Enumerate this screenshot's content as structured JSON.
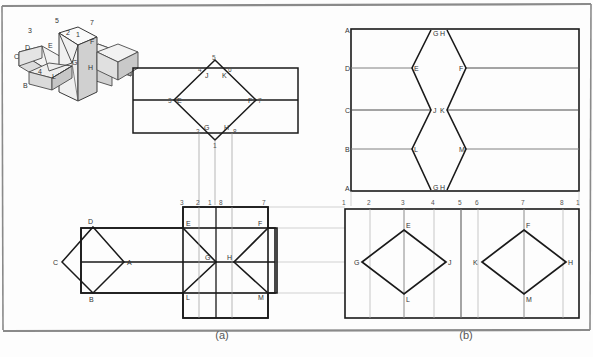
{
  "figure": {
    "captions": [
      {
        "key": "a",
        "text": "(a)"
      },
      {
        "key": "b",
        "text": "(b)"
      }
    ],
    "colors": {
      "outline": "#1a1a1a",
      "projector": "#9a9a9a",
      "frame": "#7d7d7d",
      "label": "#333333",
      "number": "#555555",
      "shade_light": "#efefef",
      "shade_mid": "#d8d8d8",
      "shade_dark": "#bdbdbd",
      "background": "#fdfdfd"
    }
  },
  "pictorial": {
    "name": "isometric-cross-solid",
    "vertex_labels": [
      "3",
      "5",
      "7",
      "2",
      "1",
      "D",
      "E",
      "C",
      "G",
      "F",
      "B",
      "4",
      "L",
      "H"
    ],
    "labels": [
      {
        "text": "3",
        "x": 28,
        "y": 33
      },
      {
        "text": "5",
        "x": 55,
        "y": 23
      },
      {
        "text": "7",
        "x": 90,
        "y": 25
      },
      {
        "text": "2",
        "x": 66,
        "y": 35
      },
      {
        "text": "1",
        "x": 76,
        "y": 37
      },
      {
        "text": "D",
        "x": 25,
        "y": 50
      },
      {
        "text": "E",
        "x": 48,
        "y": 48
      },
      {
        "text": "C",
        "x": 14,
        "y": 59
      },
      {
        "text": "G",
        "x": 72,
        "y": 65
      },
      {
        "text": "F",
        "x": 90,
        "y": 44
      },
      {
        "text": "B",
        "x": 23,
        "y": 88
      },
      {
        "text": "4",
        "x": 38,
        "y": 74
      },
      {
        "text": "L",
        "x": 52,
        "y": 79
      },
      {
        "text": "H",
        "x": 88,
        "y": 70
      }
    ]
  },
  "top_a": {
    "name": "top-view-a",
    "numbers": [
      {
        "text": "5",
        "x": 215,
        "y": 61
      },
      {
        "text": "4",
        "x": 200,
        "y": 71
      },
      {
        "text": "6",
        "x": 228,
        "y": 71
      },
      {
        "text": "3",
        "x": 174,
        "y": 100
      },
      {
        "text": "7",
        "x": 256,
        "y": 101
      },
      {
        "text": "2",
        "x": 198,
        "y": 132
      },
      {
        "text": "8",
        "x": 232,
        "y": 132
      },
      {
        "text": "1",
        "x": 216,
        "y": 143
      }
    ],
    "letters": [
      {
        "text": "J",
        "x": 207,
        "y": 74
      },
      {
        "text": "K",
        "x": 222,
        "y": 74
      },
      {
        "text": "E",
        "x": 183,
        "y": 100
      },
      {
        "text": "F",
        "x": 248,
        "y": 100
      },
      {
        "text": "G",
        "x": 206,
        "y": 130
      },
      {
        "text": "H",
        "x": 224,
        "y": 128
      }
    ]
  },
  "top_b": {
    "name": "development-view-b-upper",
    "left_edge_labels": [
      {
        "text": "A",
        "y": 32
      },
      {
        "text": "D",
        "y": 70
      },
      {
        "text": "C",
        "y": 110
      },
      {
        "text": "B",
        "y": 149
      },
      {
        "text": "A",
        "y": 188
      }
    ],
    "zigzag_left_labels": [
      {
        "text": "G",
        "x": 428,
        "y": 33
      },
      {
        "text": "E",
        "x": 408,
        "y": 71
      },
      {
        "text": "J",
        "x": 428,
        "y": 110
      },
      {
        "text": "L",
        "x": 408,
        "y": 149
      },
      {
        "text": "G",
        "x": 428,
        "y": 188
      }
    ],
    "zigzag_right_labels": [
      {
        "text": "H",
        "x": 447,
        "y": 33
      },
      {
        "text": "F",
        "x": 468,
        "y": 71
      },
      {
        "text": "K",
        "x": 447,
        "y": 110
      },
      {
        "text": "M",
        "x": 468,
        "y": 149
      },
      {
        "text": "H",
        "x": 447,
        "y": 188
      }
    ]
  },
  "bottom_a": {
    "name": "front-view-a",
    "top_numbers": [
      {
        "text": "3",
        "x": 178,
        "y": 203
      },
      {
        "text": "2",
        "x": 209,
        "y": 203
      },
      {
        "text": "1",
        "x": 221,
        "y": 203
      },
      {
        "text": "8",
        "x": 233,
        "y": 203
      },
      {
        "text": "7",
        "x": 263,
        "y": 203
      }
    ],
    "diamond_labels": [
      {
        "text": "D",
        "x": 84,
        "y": 231
      },
      {
        "text": "C",
        "x": 55,
        "y": 263
      },
      {
        "text": "A",
        "x": 117,
        "y": 262
      },
      {
        "text": "B",
        "x": 85,
        "y": 295
      }
    ],
    "cross_labels": [
      {
        "text": "E",
        "x": 186,
        "y": 232
      },
      {
        "text": "F",
        "x": 252,
        "y": 232
      },
      {
        "text": "G",
        "x": 208,
        "y": 264
      },
      {
        "text": "H",
        "x": 228,
        "y": 264
      },
      {
        "text": "L",
        "x": 187,
        "y": 292
      },
      {
        "text": "M",
        "x": 252,
        "y": 292
      }
    ]
  },
  "bottom_b": {
    "name": "front-view-b-development",
    "top_numbers": [
      {
        "text": "1",
        "x": 343,
        "y": 203
      },
      {
        "text": "2",
        "x": 368,
        "y": 203
      },
      {
        "text": "3",
        "x": 400,
        "y": 203
      },
      {
        "text": "4",
        "x": 432,
        "y": 203
      },
      {
        "text": "5",
        "x": 459,
        "y": 203
      },
      {
        "text": "6",
        "x": 477,
        "y": 203
      },
      {
        "text": "7",
        "x": 524,
        "y": 203
      },
      {
        "text": "8",
        "x": 562,
        "y": 203
      },
      {
        "text": "1",
        "x": 578,
        "y": 203
      }
    ],
    "left_diamond_labels": [
      {
        "text": "E",
        "x": 404,
        "y": 234
      },
      {
        "text": "G",
        "x": 358,
        "y": 264
      },
      {
        "text": "J",
        "x": 446,
        "y": 264
      },
      {
        "text": "L",
        "x": 404,
        "y": 296
      }
    ],
    "right_diamond_labels": [
      {
        "text": "F",
        "x": 524,
        "y": 234
      },
      {
        "text": "K",
        "x": 473,
        "y": 264
      },
      {
        "text": "H",
        "x": 566,
        "y": 264
      },
      {
        "text": "M",
        "x": 524,
        "y": 296
      }
    ]
  }
}
